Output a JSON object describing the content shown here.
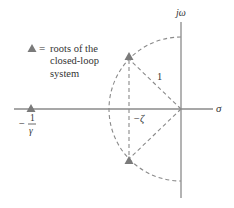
{
  "diagram": {
    "axes": {
      "vertical_label": "jω",
      "horizontal_label": "σ"
    },
    "legend": {
      "symbol": "triangle",
      "equals": "=",
      "lines": [
        "roots of the",
        "closed-loop",
        "system"
      ]
    },
    "labels": {
      "radius": "1",
      "neg_zeta": "−ζ",
      "neg_sign": "−",
      "one_over_gamma_num": "1",
      "one_over_gamma_den": "γ"
    },
    "colors": {
      "line": "#7a7a7a",
      "marker": "#7a7a7a",
      "text": "#333333"
    }
  }
}
